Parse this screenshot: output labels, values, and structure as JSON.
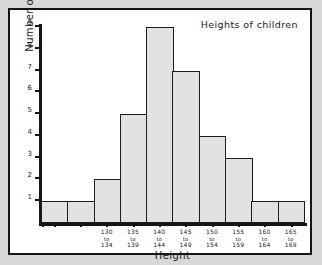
{
  "chart_data": {
    "type": "bar",
    "title": "Heights of children",
    "xlabel": "Height",
    "ylabel": "Number of children",
    "categories": [
      "",
      "",
      "130 to 134",
      "135 to 139",
      "140 to 144",
      "145 to 149",
      "150 to 154",
      "155 to 159",
      "160 to 164",
      "165 to 169"
    ],
    "category_parts": [
      {
        "from": "",
        "to": "",
        "end": ""
      },
      {
        "from": "",
        "to": "",
        "end": ""
      },
      {
        "from": "130",
        "to": "to",
        "end": "134"
      },
      {
        "from": "135",
        "to": "to",
        "end": "139"
      },
      {
        "from": "140",
        "to": "to",
        "end": "144"
      },
      {
        "from": "145",
        "to": "to",
        "end": "149"
      },
      {
        "from": "150",
        "to": "to",
        "end": "154"
      },
      {
        "from": "155",
        "to": "to",
        "end": "159"
      },
      {
        "from": "160",
        "to": "to",
        "end": "164"
      },
      {
        "from": "165",
        "to": "to",
        "end": "169"
      }
    ],
    "values": [
      1,
      1,
      2,
      5,
      9,
      7,
      4,
      3,
      1,
      1
    ],
    "ylim": [
      0,
      9
    ],
    "yticks": [
      "1",
      "2",
      "3",
      "4",
      "5",
      "6",
      "7",
      "8",
      "9"
    ],
    "grid": false,
    "legend": null,
    "bar_fill": "#e2e2e2",
    "bar_stroke": "#1d1d1d",
    "axis_color": "#151515",
    "plot_background": "#ffffff",
    "page_background": "#d8d8d8"
  }
}
